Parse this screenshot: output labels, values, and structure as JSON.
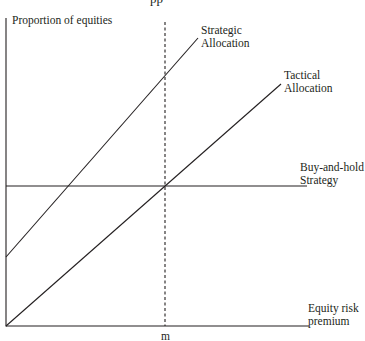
{
  "diagram": {
    "clipped_caption_fragment": "pp",
    "y_axis_label": "Proportion of equities",
    "x_axis_label_line1": "Equity risk",
    "x_axis_label_line2": "premium",
    "x_marker_label": "m",
    "lines": [
      {
        "name": "strategic-allocation",
        "label_line1": "Strategic",
        "label_line2": "Allocation",
        "style": "solid"
      },
      {
        "name": "tactical-allocation",
        "label_line1": "Tactical",
        "label_line2": "Allocation",
        "style": "solid"
      },
      {
        "name": "buy-and-hold-strategy",
        "label_line1": "Buy-and-hold",
        "label_line2": "Strategy",
        "style": "solid"
      },
      {
        "name": "m-marker",
        "style": "dashed"
      }
    ],
    "colors": {
      "ink": "#231f20",
      "background": "#ffffff"
    }
  }
}
